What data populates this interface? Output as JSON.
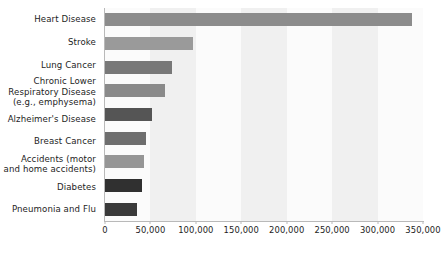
{
  "chart_data": {
    "type": "bar",
    "orientation": "horizontal",
    "title": "",
    "subtitle": "",
    "xlabel": "",
    "ylabel": "",
    "xlim": [
      0,
      350000
    ],
    "ylim": null,
    "grid": false,
    "legend": null,
    "legend_position": "none",
    "categories": [
      "Heart Disease",
      "Stroke",
      "Lung Cancer",
      "Chronic Lower Respiratory Disease (e.g., emphysema)",
      "Alzheimer's Disease",
      "Breast Cancer",
      "Accidents (motor and home accidents)",
      "Diabetes",
      "Pneumonia and Flu"
    ],
    "values": [
      338000,
      97000,
      74000,
      66000,
      52000,
      45000,
      43000,
      41000,
      35000
    ],
    "bar_colors": [
      "#8c8c8c",
      "#9a9a9a",
      "#787878",
      "#8a8a8a",
      "#555555",
      "#6e6e6e",
      "#969696",
      "#303030",
      "#3a3a3a"
    ],
    "xticks": [
      0,
      50000,
      100000,
      150000,
      200000,
      250000,
      300000,
      350000
    ],
    "xtick_labels": [
      "0",
      "50,000",
      "100,000",
      "150,000",
      "200,000",
      "250,000",
      "300,000",
      "350,000"
    ],
    "category_label_lines": [
      [
        "Heart Disease"
      ],
      [
        "Stroke"
      ],
      [
        "Lung Cancer"
      ],
      [
        "Chronic Lower",
        "Respiratory Disease",
        "(e.g., emphysema)"
      ],
      [
        "Alzheimer's Disease"
      ],
      [
        "Breast Cancer"
      ],
      [
        "Accidents (motor",
        "and home accidents)"
      ],
      [
        "Diabetes"
      ],
      [
        "Pneumonia and Flu"
      ]
    ]
  },
  "colors": {
    "background": "#ffffff",
    "axis_line": "#b9b9b9",
    "band_light": "#fbfbfb",
    "band_dark": "#f0f0f0",
    "text": "#1d1d1d"
  }
}
